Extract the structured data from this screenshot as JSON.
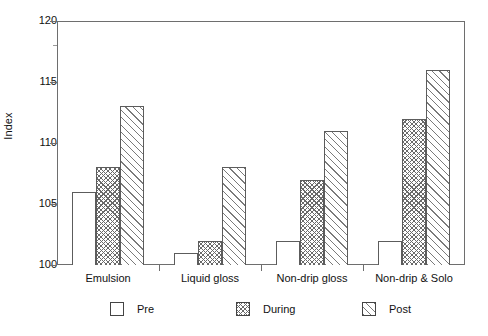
{
  "chart_data": {
    "type": "bar",
    "title": "",
    "subtitle": "",
    "xlabel": "",
    "ylabel": "Index",
    "categories": [
      "Emulsion",
      "Liquid gloss",
      "Non-drip gloss",
      "Non-drip & Solo"
    ],
    "series": [
      {
        "name": "Pre",
        "values": [
          106,
          101,
          102,
          102
        ],
        "fill": "solid-white"
      },
      {
        "name": "During",
        "values": [
          108,
          102,
          107,
          112
        ],
        "fill": "crosshatch"
      },
      {
        "name": "Post",
        "values": [
          113,
          108,
          111,
          116
        ],
        "fill": "diagonal-hatch"
      }
    ],
    "ylim": [
      100,
      120
    ],
    "yticks": [
      100,
      105,
      110,
      115,
      120
    ],
    "ytick_labels": [
      "100",
      "105",
      "110",
      "115",
      "120"
    ],
    "grid": false,
    "legend_position": "bottom",
    "baseline": 100
  },
  "axis": {
    "y_title": "Index",
    "y_tick_labels": [
      "120",
      "115",
      "110",
      "105",
      "100"
    ],
    "x_tick_labels": [
      "Emulsion",
      "Liquid gloss",
      "Non-drip gloss",
      "Non-drip & Solo"
    ]
  },
  "legend": {
    "entries": [
      {
        "label": "Pre",
        "pattern": "empty-square"
      },
      {
        "label": "During",
        "pattern": "crosshatch-square"
      },
      {
        "label": "Post",
        "pattern": "diagonal-hatch-square"
      }
    ]
  },
  "style": {
    "axis_color": "#6e6e6e",
    "bar_border_color": "#5c5c5c",
    "hatch_color": "#6a6a6a",
    "text_color": "#111111",
    "background": "#ffffff"
  }
}
